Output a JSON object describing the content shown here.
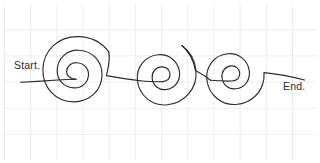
{
  "figure": {
    "type": "hand-drawn-diagram",
    "background": "#ffffff",
    "grid": {
      "visible": true,
      "color": "#ececed",
      "cell_size_px": 26
    },
    "ink_color": "#2b2b30",
    "stroke_width": 1.15
  },
  "labels": {
    "start": "Start.",
    "end": "End."
  },
  "path": {
    "description": "A single continuous line entering from the left, coiling into three successive spirals and exiting to the right.",
    "spiral_count": 3,
    "direction": "inward-counterclockwise",
    "turns_per_spiral": 2.5,
    "spirals": [
      {
        "name": "spiral-1",
        "center_x": 76,
        "center_y": 79,
        "outer_radius": 30
      },
      {
        "name": "spiral-2",
        "center_x": 165,
        "center_y": 81,
        "outer_radius": 27
      },
      {
        "name": "spiral-3",
        "center_x": 235,
        "center_y": 80,
        "outer_radius": 27
      }
    ],
    "connectors": [
      {
        "name": "start-lead-in",
        "from_x": 20,
        "from_y": 82,
        "to_x": 76,
        "to_y": 79
      },
      {
        "name": "connector-1-2",
        "from_x": 106,
        "from_y": 76,
        "to_x": 138,
        "to_y": 81
      },
      {
        "name": "connector-2-3",
        "from_x": 193,
        "from_y": 77,
        "to_x": 210,
        "to_y": 81
      },
      {
        "name": "end-lead-out",
        "from_x": 262,
        "from_y": 73,
        "to_x": 305,
        "to_y": 80
      }
    ]
  }
}
